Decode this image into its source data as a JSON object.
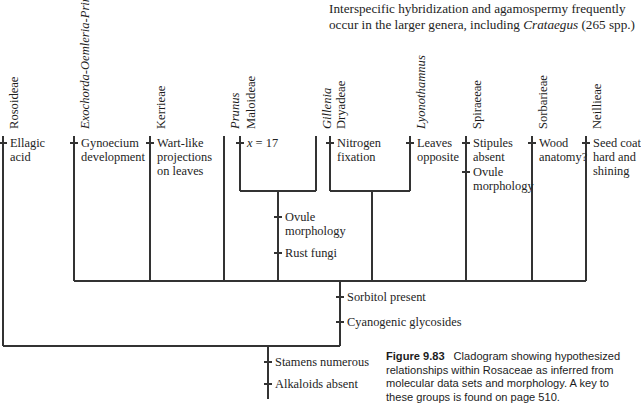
{
  "body_text": {
    "line1_a": "Interspecific hybridization and agamospermy frequently",
    "line2_a": "occur in the larger genera, including ",
    "line2_italic": "Crataegus",
    "line2_b": " (265 spp.)"
  },
  "caption": {
    "figure_number": "Figure 9.83",
    "text": "Cladogram showing hypothesized relationships within Rosaceae as inferred from molecular data sets and morphology. A key to these groups is found on page 510."
  },
  "cladogram": {
    "type": "cladogram",
    "title": "Cladogram showing hypothesized relationships within Rosaceae",
    "taxa": [
      {
        "id": "rosoideae",
        "label": "Rosoideae",
        "italic": false,
        "x": 3,
        "tip_y": 136,
        "base_y": 346
      },
      {
        "id": "exochorda",
        "label": "Exochorda-Oemleria-Prinsepia",
        "italic": true,
        "x": 74,
        "tip_y": 136,
        "base_y": 281
      },
      {
        "id": "kerrieae",
        "label": "Kerrieae",
        "italic": false,
        "x": 150,
        "tip_y": 136,
        "base_y": 281
      },
      {
        "id": "prunus",
        "label": "Prunus",
        "italic": true,
        "x": 224,
        "tip_y": 136,
        "base_y": 281
      },
      {
        "id": "maloideae",
        "label": "Maloideae",
        "italic": false,
        "x": 240,
        "tip_y": 136,
        "base_y": 191
      },
      {
        "id": "gillenia",
        "label": "Gillenia",
        "italic": true,
        "x": 316,
        "tip_y": 136,
        "base_y": 191
      },
      {
        "id": "dryadeae",
        "label": "Dryadeae",
        "italic": false,
        "x": 330,
        "tip_y": 136,
        "base_y": 191
      },
      {
        "id": "lyonothamnus",
        "label": "Lyonothamnus",
        "italic": true,
        "x": 410,
        "tip_y": 136,
        "base_y": 191
      },
      {
        "id": "spiraeeae",
        "label": "Spiraeeae",
        "italic": false,
        "x": 466,
        "tip_y": 136,
        "base_y": 281
      },
      {
        "id": "sorbarieae",
        "label": "Sorbarieae",
        "italic": false,
        "x": 532,
        "tip_y": 136,
        "base_y": 281
      },
      {
        "id": "neillieae",
        "label": "Neillieae",
        "italic": false,
        "x": 586,
        "tip_y": 136,
        "base_y": 281
      }
    ],
    "internal_nodes": [
      {
        "id": "maloideae-gillenia-clade",
        "x": 278,
        "bar_y": 191,
        "bar_x1": 240,
        "bar_x2": 316,
        "base_y": 281
      },
      {
        "id": "dryadeae-lyonothamnus-clade",
        "x": 372,
        "bar_y": 191,
        "bar_x1": 330,
        "bar_x2": 410,
        "base_y": 281
      },
      {
        "id": "main-clade",
        "x": 340,
        "bar_y": 281,
        "bar_x1": 74,
        "bar_x2": 586,
        "base_y": 346
      },
      {
        "id": "root-clade",
        "x": 268,
        "bar_y": 346,
        "bar_x1": 3,
        "bar_x2": 340,
        "base_y": 399
      }
    ],
    "characters": [
      {
        "id": "ellagic-acid",
        "text": "Ellagic acid",
        "branch_x": 3,
        "tick_y": 143,
        "label_x": 10,
        "label_y": 136,
        "width": 58
      },
      {
        "id": "gynoecium-development",
        "text": "Gynoecium development",
        "branch_x": 74,
        "tick_y": 143,
        "label_x": 81,
        "label_y": 136,
        "width": 70
      },
      {
        "id": "wart-like-projections",
        "text": "Wart-like projections on leaves",
        "branch_x": 150,
        "tick_y": 143,
        "label_x": 157,
        "label_y": 136,
        "width": 68
      },
      {
        "id": "chromosome-number",
        "text": "x = 17",
        "branch_x": 240,
        "tick_y": 143,
        "label_x": 247,
        "label_y": 136,
        "width": 70,
        "italic_var": true
      },
      {
        "id": "nitrogen-fixation",
        "text": "Nitrogen fixation",
        "branch_x": 330,
        "tick_y": 143,
        "label_x": 337,
        "label_y": 136,
        "width": 75
      },
      {
        "id": "leaves-opposite",
        "text": "Leaves opposite",
        "branch_x": 410,
        "tick_y": 143,
        "label_x": 417,
        "label_y": 136,
        "width": 52
      },
      {
        "id": "stipules-absent",
        "text": "Stipules absent",
        "branch_x": 466,
        "tick_y": 143,
        "label_x": 473,
        "label_y": 136,
        "width": 58
      },
      {
        "id": "ovule-morphology-spiraeeae",
        "text": "Ovule morphology",
        "branch_x": 466,
        "tick_y": 172,
        "label_x": 473,
        "label_y": 165,
        "width": 58
      },
      {
        "id": "wood-anatomy",
        "text": "Wood anatomy?",
        "branch_x": 532,
        "tick_y": 143,
        "label_x": 539,
        "label_y": 136,
        "width": 50
      },
      {
        "id": "seed-coat",
        "text": "Seed coat hard and shining",
        "branch_x": 586,
        "tick_y": 143,
        "label_x": 593,
        "label_y": 136,
        "width": 48
      },
      {
        "id": "ovule-morphology-maloid",
        "text": "Ovule morphology",
        "branch_x": 278,
        "tick_y": 217,
        "label_x": 285,
        "label_y": 210,
        "width": 56
      },
      {
        "id": "rust-fungi",
        "text": "Rust fungi",
        "branch_x": 278,
        "tick_y": 253,
        "label_x": 285,
        "label_y": 246,
        "width": 60
      },
      {
        "id": "sorbitol-present",
        "text": "Sorbitol present",
        "branch_x": 340,
        "tick_y": 297,
        "label_x": 347,
        "label_y": 290,
        "width": 120
      },
      {
        "id": "cyanogenic-glycosides",
        "text": "Cyanogenic glycosides",
        "branch_x": 340,
        "tick_y": 322,
        "label_x": 347,
        "label_y": 315,
        "width": 140
      },
      {
        "id": "stamens-numerous",
        "text": "Stamens numerous",
        "branch_x": 268,
        "tick_y": 362,
        "label_x": 275,
        "label_y": 355,
        "width": 120
      },
      {
        "id": "alkaloids-absent",
        "text": "Alkaloids absent",
        "branch_x": 268,
        "tick_y": 384,
        "label_x": 275,
        "label_y": 377,
        "width": 120
      }
    ],
    "style": {
      "line_color": "#333333",
      "line_width": 1.3,
      "tick_half_len": 4
    }
  }
}
